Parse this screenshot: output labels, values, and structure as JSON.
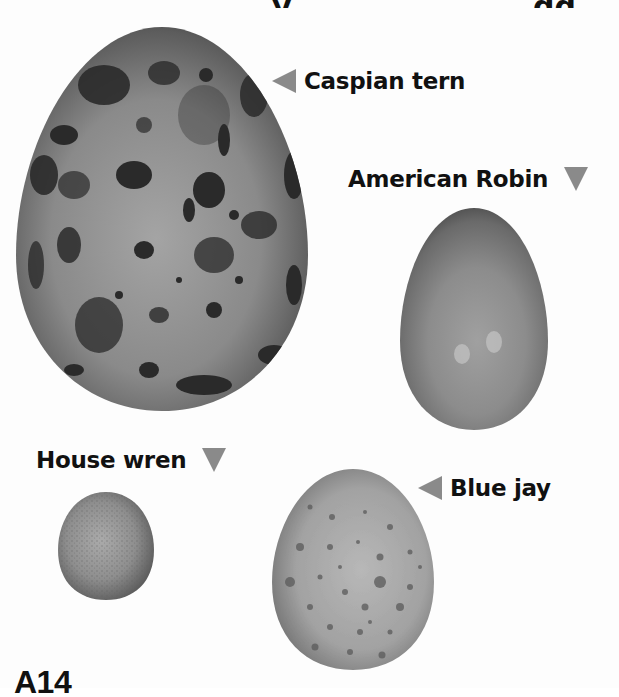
{
  "page": {
    "background": "#fdfdfd",
    "page_number": "A14"
  },
  "title": {
    "note": "",
    "visible_fragments": [
      "y",
      "gg"
    ]
  },
  "eggs": [
    {
      "id": "caspian-tern",
      "label": "Caspian tern",
      "marker": "triangle-left",
      "color": "#7a7a7a",
      "pattern": "large dark blotches"
    },
    {
      "id": "american-robin",
      "label": "American Robin",
      "marker": "triangle-down",
      "color": "#8c8c8c",
      "pattern": "plain"
    },
    {
      "id": "house-wren",
      "label": "House wren",
      "marker": "triangle-down",
      "color": "#8e8e8e",
      "pattern": "fine speckles"
    },
    {
      "id": "blue-jay",
      "label": "Blue jay",
      "marker": "triangle-left",
      "color": "#a3a3a3",
      "pattern": "small spots"
    }
  ],
  "colors": {
    "marker": "#8a8a8a",
    "text": "#111111"
  }
}
